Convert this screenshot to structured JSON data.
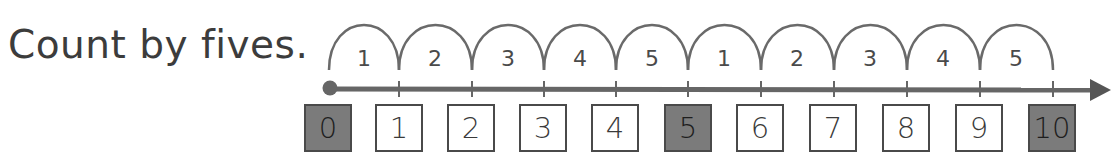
{
  "instruction": "Count by fives.",
  "number_line": {
    "start": 0,
    "end": 10,
    "line_color": "#666666",
    "highlight_color": "#7b7b7b",
    "hops": [
      {
        "label": "1"
      },
      {
        "label": "2"
      },
      {
        "label": "3"
      },
      {
        "label": "4"
      },
      {
        "label": "5"
      },
      {
        "label": "1"
      },
      {
        "label": "2"
      },
      {
        "label": "3"
      },
      {
        "label": "4"
      },
      {
        "label": "5"
      }
    ],
    "boxes": [
      {
        "value": "0",
        "highlighted": true
      },
      {
        "value": "1",
        "highlighted": false
      },
      {
        "value": "2",
        "highlighted": false
      },
      {
        "value": "3",
        "highlighted": false
      },
      {
        "value": "4",
        "highlighted": false
      },
      {
        "value": "5",
        "highlighted": true
      },
      {
        "value": "6",
        "highlighted": false
      },
      {
        "value": "7",
        "highlighted": false
      },
      {
        "value": "8",
        "highlighted": false
      },
      {
        "value": "9",
        "highlighted": false
      },
      {
        "value": "10",
        "highlighted": true
      }
    ]
  }
}
